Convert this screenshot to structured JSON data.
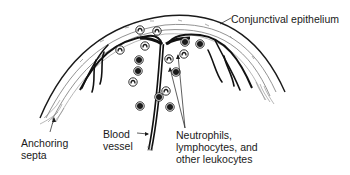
{
  "diagram": {
    "labels": {
      "conjunctival_epithelium": [
        "Conjunctival epithelium"
      ],
      "anchoring_septa": [
        "Anchoring",
        "septa"
      ],
      "blood_vessel": [
        "Blood",
        "vessel"
      ],
      "leukocytes": [
        "Neutrophils,",
        "lymphocytes, and",
        "other leukocytes"
      ]
    },
    "cells": {
      "description": "Scattered leukocytes (neutrophils with lobed nuclei, lymphocytes with dark round nuclei) surrounding a central blood vessel",
      "items": [
        {
          "kind": "neutrophil"
        },
        {
          "kind": "neutrophil"
        },
        {
          "kind": "neutrophil"
        },
        {
          "kind": "neutrophil"
        },
        {
          "kind": "neutrophil"
        },
        {
          "kind": "neutrophil"
        },
        {
          "kind": "neutrophil"
        },
        {
          "kind": "neutrophil"
        },
        {
          "kind": "lymphocyte"
        },
        {
          "kind": "lymphocyte"
        },
        {
          "kind": "lymphocyte"
        },
        {
          "kind": "lymphocyte"
        },
        {
          "kind": "lymphocyte"
        },
        {
          "kind": "lymphocyte"
        },
        {
          "kind": "lymphocyte"
        },
        {
          "kind": "lymphocyte"
        }
      ]
    },
    "colors": {
      "ink": "#1a1a1a",
      "light_ink": "#8a8a8a",
      "background": "#ffffff"
    }
  }
}
